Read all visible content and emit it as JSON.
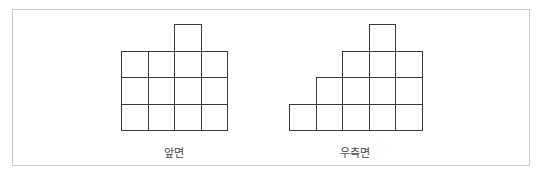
{
  "figure": {
    "views": [
      {
        "name": "front",
        "label": "앞면",
        "origin_x": 121,
        "bottom_y": 130,
        "cell_size": 26.5,
        "column_heights": [
          3,
          3,
          4,
          3
        ]
      },
      {
        "name": "right-side",
        "label": "우측면",
        "origin_x": 289,
        "bottom_y": 130,
        "cell_size": 26.5,
        "column_heights": [
          1,
          2,
          3,
          4,
          3
        ]
      }
    ],
    "colors": {
      "line": "#3a3a3a",
      "frame": "#c8c8c8",
      "background": "#ffffff"
    }
  }
}
